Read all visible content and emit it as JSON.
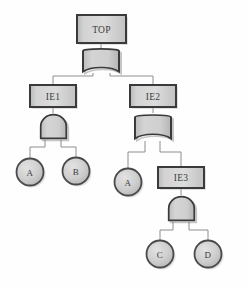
{
  "diagram": {
    "background_color": "#fefefe",
    "palette": {
      "box_fill_light": "#d6d6d6",
      "box_fill_dark": "#b4b4b4",
      "box_border": "#3a3a3a",
      "gate_fill": "#c9c9c9",
      "gate_border": "#3a3a3a",
      "circle_fill": "#c6c6c6",
      "circle_border": "#4a4a4a",
      "connector": "#8e8e8e",
      "text": "#3b3b3b",
      "shadow": "#bfbfbf"
    },
    "nodes": {
      "top": {
        "label": "TOP",
        "type": "event-box"
      },
      "ie1": {
        "label": "IE1",
        "type": "event-box"
      },
      "ie2": {
        "label": "IE2",
        "type": "event-box"
      },
      "ie3": {
        "label": "IE3",
        "type": "event-box"
      },
      "a1": {
        "label": "A",
        "type": "basic-event"
      },
      "b1": {
        "label": "B",
        "type": "basic-event"
      },
      "a2": {
        "label": "A",
        "type": "basic-event"
      },
      "c1": {
        "label": "C",
        "type": "basic-event"
      },
      "d1": {
        "label": "D",
        "type": "basic-event"
      }
    },
    "gates": {
      "g_top": {
        "type": "OR",
        "parent": "TOP",
        "children": [
          "IE1",
          "IE2"
        ]
      },
      "g_ie1": {
        "type": "AND",
        "parent": "IE1",
        "children": [
          "A",
          "B"
        ]
      },
      "g_ie2": {
        "type": "OR",
        "parent": "IE2",
        "children": [
          "A",
          "IE3"
        ]
      },
      "g_ie3": {
        "type": "AND",
        "parent": "IE3",
        "children": [
          "C",
          "D"
        ]
      }
    }
  }
}
